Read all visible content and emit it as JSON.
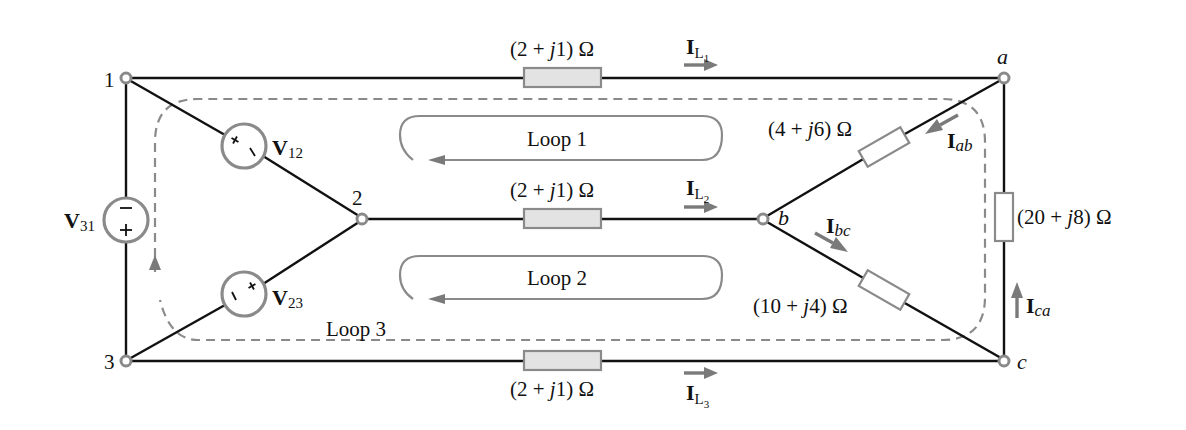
{
  "nodes": {
    "n1": "1",
    "n2": "2",
    "n3": "3",
    "a": "a",
    "b": "b",
    "c": "c"
  },
  "sources": {
    "v12": {
      "main": "V",
      "sub": "12"
    },
    "v23": {
      "main": "V",
      "sub": "23"
    },
    "v31": {
      "main": "V",
      "sub": "31"
    }
  },
  "impedances": {
    "line1": "(2 + j1) Ω",
    "line2": "(2 + j1) Ω",
    "line3": "(2 + j1) Ω",
    "load_ab": "(4 + j6) Ω",
    "load_bc": "(10 + j4) Ω",
    "load_ca": "(20 + j8) Ω"
  },
  "impedance_parts": {
    "line": {
      "pre": "(2 + ",
      "j": "j",
      "post": "1) Ω"
    },
    "ab": {
      "pre": "(4 + ",
      "j": "j",
      "post": "6) Ω"
    },
    "bc": {
      "pre": "(10 + ",
      "j": "j",
      "post": "4) Ω"
    },
    "ca": {
      "pre": "(20 + ",
      "j": "j",
      "post": "8) Ω"
    }
  },
  "currents": {
    "il1": {
      "main": "I",
      "sub": "L",
      "subsub": "1"
    },
    "il2": {
      "main": "I",
      "sub": "L",
      "subsub": "2"
    },
    "il3": {
      "main": "I",
      "sub": "L",
      "subsub": "3"
    },
    "iab": {
      "main": "I",
      "sub": "ab"
    },
    "ibc": {
      "main": "I",
      "sub": "bc"
    },
    "ica": {
      "main": "I",
      "sub": "ca"
    }
  },
  "loops": {
    "loop1": "Loop 1",
    "loop2": "Loop 2",
    "loop3": "Loop 3"
  },
  "colors": {
    "wire": "#111111",
    "component_stroke": "#8a8a8a",
    "line_resistor_fill": "#e3e3e3",
    "arrow": "#7a7a7a"
  }
}
